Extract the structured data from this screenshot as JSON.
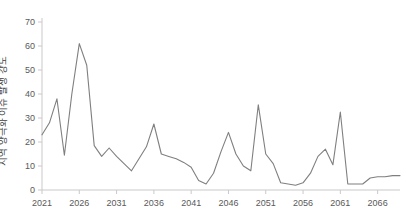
{
  "chart_data": {
    "type": "line",
    "title": "",
    "subtitle": "",
    "xlabel": "",
    "ylabel": "지역 양극화 이슈 발생 강도",
    "xlim": [
      2021,
      2069
    ],
    "ylim": [
      0,
      70
    ],
    "grid": false,
    "legend": false,
    "legend_position": "none",
    "line_color": "#7f7f7f",
    "axis_color": "#c9c9c9",
    "tick_text_color": "#595959",
    "xticks": [
      2021,
      2026,
      2031,
      2036,
      2041,
      2046,
      2051,
      2056,
      2061,
      2066
    ],
    "yticks": [
      0,
      10,
      20,
      30,
      40,
      50,
      60,
      70
    ],
    "x": [
      2021,
      2022,
      2023,
      2024,
      2025,
      2026,
      2027,
      2028,
      2029,
      2030,
      2031,
      2032,
      2033,
      2034,
      2035,
      2036,
      2037,
      2038,
      2039,
      2040,
      2041,
      2042,
      2043,
      2044,
      2045,
      2046,
      2047,
      2048,
      2049,
      2050,
      2051,
      2052,
      2053,
      2054,
      2055,
      2056,
      2057,
      2058,
      2059,
      2060,
      2061,
      2062,
      2063,
      2064,
      2065,
      2066,
      2067,
      2068,
      2069
    ],
    "values": [
      23,
      28,
      38,
      14.5,
      40,
      61,
      52,
      18.5,
      14,
      17.5,
      14,
      11,
      8,
      13,
      18,
      27.5,
      15,
      14,
      13,
      11.5,
      9.5,
      4,
      2.5,
      7,
      16,
      24,
      15,
      10,
      8,
      35.5,
      15,
      11,
      3,
      2.5,
      2,
      3,
      7,
      14,
      17,
      10.5,
      32.5,
      2.5,
      2.5,
      2.5,
      5,
      5.5,
      5.5,
      6,
      6
    ],
    "series": [
      {
        "name": "지역 양극화 이슈 발생 강도",
        "values": [
          23,
          28,
          38,
          14.5,
          40,
          61,
          52,
          18.5,
          14,
          17.5,
          14,
          11,
          8,
          13,
          18,
          27.5,
          15,
          14,
          13,
          11.5,
          9.5,
          4,
          2.5,
          7,
          16,
          24,
          15,
          10,
          8,
          35.5,
          15,
          11,
          3,
          2.5,
          2,
          3,
          7,
          14,
          17,
          10.5,
          32.5,
          2.5,
          2.5,
          2.5,
          5,
          5.5,
          5.5,
          6,
          6
        ]
      }
    ]
  }
}
